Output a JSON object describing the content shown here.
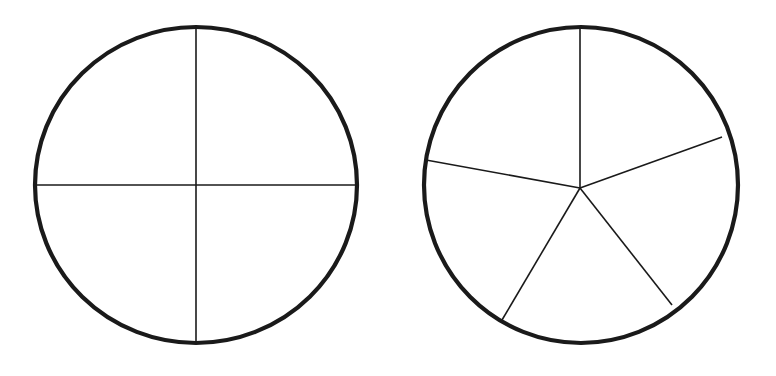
{
  "figure": {
    "background_color": "#ffffff",
    "stroke_color": "#1a1a1a",
    "canvas_width": 776,
    "canvas_height": 376,
    "outline_stroke_width": 4.2,
    "divider_stroke_width": 1.6,
    "shapes": [
      {
        "id": "left-circle",
        "name": "circle-divided-into-fourths",
        "label": "Circle divided into 4 equal parts",
        "parts": 4,
        "fraction": "1/4",
        "center_x": 196,
        "center_y": 185,
        "radius_x": 161,
        "radius_y": 158,
        "vertex_x": 196,
        "vertex_y": 185,
        "divider_angles_deg": [
          0,
          90,
          180,
          270
        ],
        "dividers": [
          {
            "name": "vertical-diameter",
            "x1": 196,
            "y1": 27,
            "x2": 196,
            "y2": 343
          },
          {
            "name": "horizontal-diameter",
            "x1": 35,
            "y1": 185,
            "x2": 357,
            "y2": 185
          }
        ]
      },
      {
        "id": "right-circle",
        "name": "circle-divided-into-fifths",
        "label": "Circle divided into 5 equal parts",
        "parts": 5,
        "fraction": "1/5",
        "center_x": 581,
        "center_y": 185,
        "radius_x": 157,
        "radius_y": 158,
        "vertex_x": 580,
        "vertex_y": 188,
        "divider_angles_deg": [
          0,
          70,
          142,
          211,
          280
        ],
        "dividers": [
          {
            "name": "radius-north",
            "x1": 580,
            "y1": 188,
            "x2": 580,
            "y2": 27
          },
          {
            "name": "radius-upper-right",
            "x1": 580,
            "y1": 188,
            "x2": 722,
            "y2": 137
          },
          {
            "name": "radius-lower-right",
            "x1": 580,
            "y1": 188,
            "x2": 672,
            "y2": 305
          },
          {
            "name": "radius-lower-left",
            "x1": 580,
            "y1": 188,
            "x2": 502,
            "y2": 320
          },
          {
            "name": "radius-west",
            "x1": 580,
            "y1": 188,
            "x2": 426,
            "y2": 160
          }
        ]
      }
    ]
  },
  "chart_data": {
    "type": "pie",
    "title": "",
    "subtitle": "",
    "xlabel": "",
    "ylabel": "",
    "legend_position": "none",
    "grid": false,
    "charts": [
      {
        "name": "circle-divided-into-fourths",
        "type": "pie",
        "labels": [
          "1/4",
          "1/4",
          "1/4",
          "1/4"
        ],
        "values": [
          25,
          25,
          25,
          25
        ],
        "slice_count": 4,
        "slice_angles_deg": [
          90,
          90,
          90,
          90
        ],
        "start_angle_deg": 0,
        "shaded": []
      },
      {
        "name": "circle-divided-into-fifths",
        "type": "pie",
        "labels": [
          "1/5",
          "1/5",
          "1/5",
          "1/5",
          "1/5"
        ],
        "values": [
          20,
          20,
          20,
          20,
          20
        ],
        "slice_count": 5,
        "slice_angles_deg": [
          70,
          72,
          69,
          69,
          80
        ],
        "start_angle_deg": 0,
        "shaded": []
      }
    ]
  }
}
